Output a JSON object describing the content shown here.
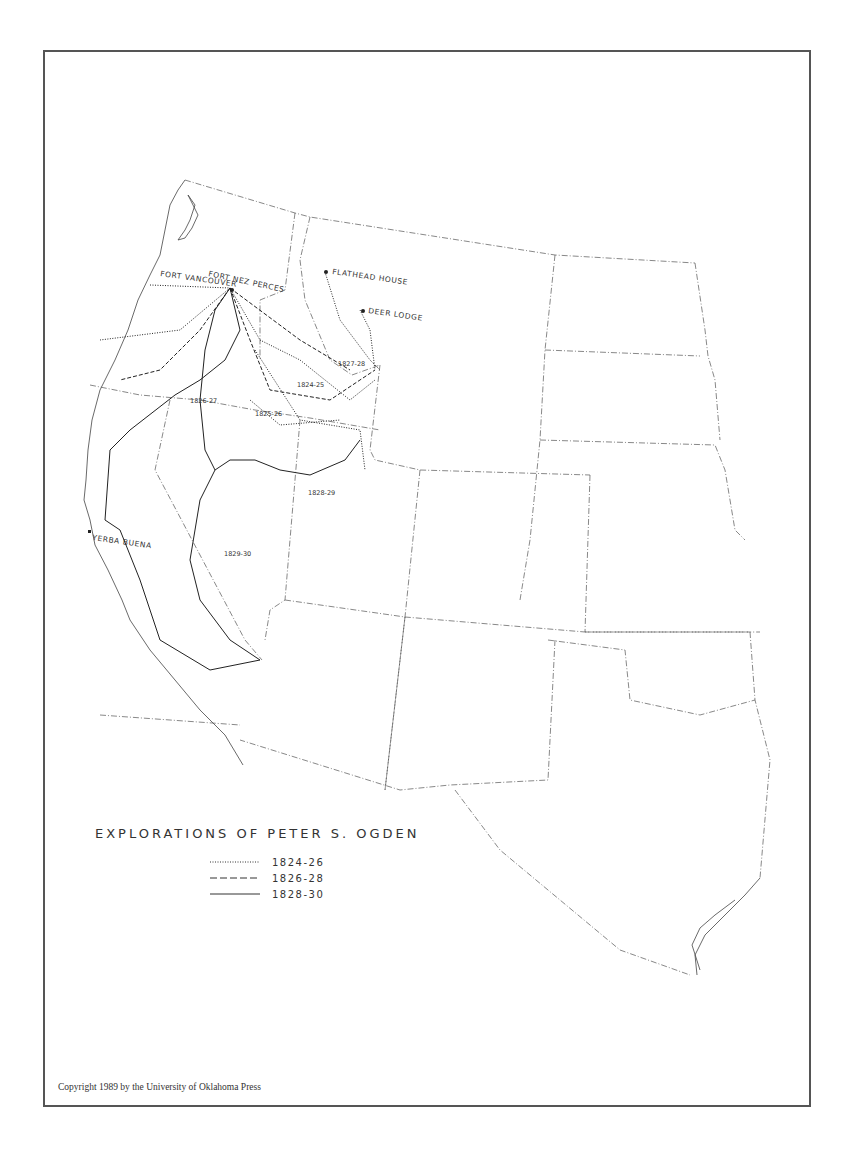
{
  "map": {
    "title": "EXPLORATIONS OF PETER S. OGDEN",
    "places": [
      {
        "id": "fort-vancouver",
        "label": "FORT VANCOUVER"
      },
      {
        "id": "fort-nez-perces",
        "label": "FORT NEZ PERCES"
      },
      {
        "id": "flathead-house",
        "label": "FLATHEAD HOUSE"
      },
      {
        "id": "deer-lodge",
        "label": "DEER LODGE"
      },
      {
        "id": "yerba-buena",
        "label": "YERBA BUENA"
      }
    ],
    "route_labels": [
      "1824-25",
      "1825-26",
      "1826-27",
      "1827-28",
      "1828-29",
      "1829-30"
    ],
    "legend": [
      {
        "style": "dotted",
        "label": "1824-26"
      },
      {
        "style": "dashed",
        "label": "1826-28"
      },
      {
        "style": "solid",
        "label": "1828-30"
      }
    ],
    "copyright": "Copyright 1989 by the University of Oklahoma Press"
  },
  "colors": {
    "ink": "#333333",
    "frame": "#555555",
    "background": "#ffffff"
  }
}
